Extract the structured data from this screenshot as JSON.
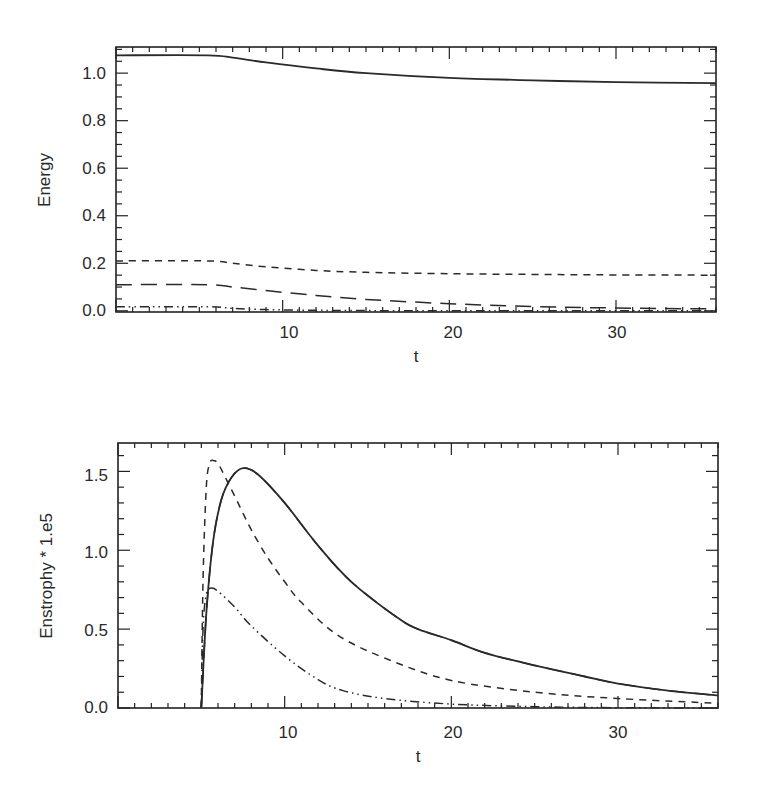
{
  "chart_data": [
    {
      "type": "line",
      "title": "",
      "xlabel": "t",
      "ylabel": "Energy",
      "xlim": [
        0,
        36
      ],
      "ylim": [
        -0.005,
        1.11
      ],
      "grid": false,
      "legend": "none",
      "xticks": [
        10,
        20,
        30
      ],
      "xtick_labels": [
        "10",
        "20",
        "30"
      ],
      "yticks": [
        0.0,
        0.2,
        0.4,
        0.6,
        0.8,
        1.0
      ],
      "ytick_labels": [
        "0.0",
        "0.2",
        "0.4",
        "0.6",
        "0.8",
        "1.0"
      ],
      "series": [
        {
          "name": "solid",
          "style": "solid",
          "x": [
            0,
            5.5,
            7,
            9,
            12,
            15,
            20,
            25,
            30,
            36
          ],
          "y": [
            1.075,
            1.075,
            1.065,
            1.045,
            1.02,
            1.0,
            0.98,
            0.97,
            0.962,
            0.958
          ]
        },
        {
          "name": "short-dashed",
          "style": "dash",
          "x": [
            0,
            5.5,
            7,
            9,
            12,
            15,
            20,
            25,
            30,
            36
          ],
          "y": [
            0.21,
            0.21,
            0.2,
            0.185,
            0.17,
            0.162,
            0.156,
            0.153,
            0.151,
            0.15
          ]
        },
        {
          "name": "long-dashed",
          "style": "longdash",
          "x": [
            0,
            5.5,
            7,
            9,
            12,
            15,
            20,
            25,
            30,
            36
          ],
          "y": [
            0.11,
            0.11,
            0.1,
            0.085,
            0.065,
            0.048,
            0.03,
            0.018,
            0.012,
            0.008
          ]
        },
        {
          "name": "dash-dot-dot",
          "style": "dashdotdot",
          "x": [
            0,
            5.5,
            7,
            9,
            12,
            15,
            20,
            36
          ],
          "y": [
            0.017,
            0.017,
            0.01,
            0.005,
            0.002,
            0.001,
            0.0,
            0.0
          ]
        }
      ]
    },
    {
      "type": "line",
      "title": "",
      "xlabel": "t",
      "ylabel": "Enstrophy * 1.e5",
      "xlim": [
        0,
        36
      ],
      "ylim": [
        0.0,
        1.68
      ],
      "grid": false,
      "legend": "none",
      "xticks": [
        10,
        20,
        30
      ],
      "xtick_labels": [
        "10",
        "20",
        "30"
      ],
      "yticks": [
        0.0,
        0.5,
        1.0,
        1.5
      ],
      "ytick_labels": [
        "0.0",
        "0.5",
        "1.0",
        "1.5"
      ],
      "series": [
        {
          "name": "solid",
          "style": "solid",
          "x": [
            5,
            5.3,
            5.7,
            6.2,
            6.8,
            7.5,
            8.4,
            10,
            12,
            14,
            16.8,
            18,
            20,
            22,
            25,
            28,
            30,
            33,
            36
          ],
          "y": [
            0.0,
            0.6,
            1.05,
            1.32,
            1.46,
            1.52,
            1.48,
            1.3,
            1.03,
            0.8,
            0.57,
            0.5,
            0.43,
            0.35,
            0.27,
            0.2,
            0.155,
            0.11,
            0.08
          ]
        },
        {
          "name": "long-dashed",
          "style": "longdash",
          "x": [
            5,
            5.3,
            5.7,
            6.2,
            6.8,
            7.5,
            8.4,
            10,
            12,
            14,
            16.8,
            18,
            20,
            22,
            25,
            28,
            30,
            33,
            36
          ],
          "y": [
            0.0,
            0.6,
            1.05,
            1.32,
            1.46,
            1.52,
            1.48,
            1.3,
            1.03,
            0.8,
            0.57,
            0.5,
            0.43,
            0.35,
            0.27,
            0.2,
            0.155,
            0.11,
            0.08
          ]
        },
        {
          "name": "short-dashed",
          "style": "dash",
          "x": [
            5,
            5.1,
            5.3,
            5.5,
            5.7,
            6.0,
            6.5,
            7.2,
            8,
            9,
            10,
            11,
            13.2,
            16.4,
            20,
            25,
            30,
            36
          ],
          "y": [
            0.0,
            0.8,
            1.4,
            1.55,
            1.57,
            1.55,
            1.45,
            1.3,
            1.13,
            0.95,
            0.8,
            0.67,
            0.46,
            0.3,
            0.175,
            0.1,
            0.06,
            0.03
          ]
        },
        {
          "name": "dash-dot-dot",
          "style": "dashdotdot",
          "x": [
            5,
            5.1,
            5.3,
            5.6,
            6.0,
            7,
            8,
            10,
            12,
            13.5,
            16,
            20,
            25,
            30,
            36
          ],
          "y": [
            0.0,
            0.5,
            0.72,
            0.76,
            0.74,
            0.64,
            0.52,
            0.33,
            0.18,
            0.11,
            0.06,
            0.025,
            0.008,
            0.002,
            0.0
          ]
        }
      ]
    }
  ],
  "plots": {
    "top": {
      "xlabel": "t",
      "ylabel": "Energy",
      "xticks": [
        "10",
        "20",
        "30"
      ],
      "yticks": [
        "0.0",
        "0.2",
        "0.4",
        "0.6",
        "0.8",
        "1.0"
      ]
    },
    "bottom": {
      "xlabel": "t",
      "ylabel": "Enstrophy * 1.e5",
      "xticks": [
        "10",
        "20",
        "30"
      ],
      "yticks": [
        "0.0",
        "0.5",
        "1.0",
        "1.5"
      ]
    }
  }
}
